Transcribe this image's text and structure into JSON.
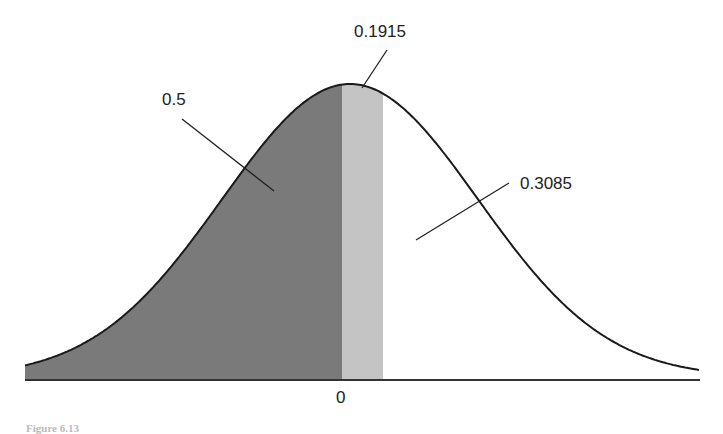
{
  "chart_data": {
    "type": "area",
    "title": "",
    "xlabel": "",
    "ylabel": "",
    "x_ticks": [
      "0"
    ],
    "regions": [
      {
        "name": "left of mean",
        "area_label": "0.5",
        "from": "-inf",
        "to": 0,
        "fill": "#7a7a7a"
      },
      {
        "name": "mean to z",
        "area_label": "0.1915",
        "from": 0,
        "to": 0.5,
        "fill": "#c4c4c4"
      },
      {
        "name": "right tail",
        "area_label": "0.3085",
        "from": 0.5,
        "to": "inf",
        "fill": "#ffffff"
      }
    ],
    "annotations": [
      "0.5",
      "0.1915",
      "0.3085"
    ],
    "grid": false,
    "legend": "none"
  },
  "labels": {
    "left_area": "0.5",
    "middle_area": "0.1915",
    "right_area": "0.3085",
    "zero_tick": "0"
  },
  "caption": "Figure 6.13",
  "colors": {
    "dark_fill": "#7a7a7a",
    "light_fill": "#c4c4c4",
    "curve": "#1a1a1a"
  }
}
